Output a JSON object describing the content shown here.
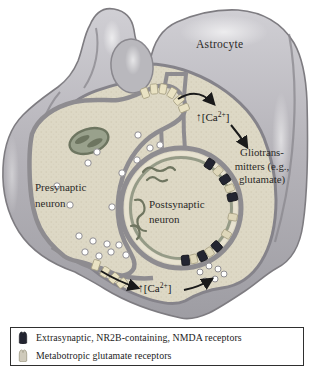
{
  "figure": {
    "labels": {
      "astrocyte": "Astrocyte",
      "presynaptic_line1": "Presynaptic",
      "presynaptic_line2": "neuron",
      "postsynaptic_line1": "Postsynaptic",
      "postsynaptic_line2": "neuron",
      "gliotransmitters_line1": "Gliotrans-",
      "gliotransmitters_line2": "mitters (e.g.,",
      "gliotransmitters_line3": "glutamate)",
      "calcium_arrow": "↑",
      "calcium_prefix": "[Ca",
      "calcium_sup": "2+",
      "calcium_suffix": "]"
    },
    "legend": {
      "items": [
        {
          "icon": "nmda-receptor-icon",
          "color": "#232531",
          "label": "Extrasynaptic, NR2B-containing, NMDA receptors"
        },
        {
          "icon": "mglur-receptor-icon",
          "color": "#cfcabb",
          "label": "Metabotropic glutamate receptors"
        }
      ]
    },
    "colors": {
      "astrocyte_gray": "#b6b4ba",
      "cytoplasm_beige": "#ddd8c5",
      "membrane_gray": "#8e8c90",
      "nmda_receptor_dark": "#232531",
      "mglur_receptor_cream": "#e9e2c3",
      "vesicle_white": "#ffffff",
      "arrow_black": "#1a1a1a"
    }
  }
}
